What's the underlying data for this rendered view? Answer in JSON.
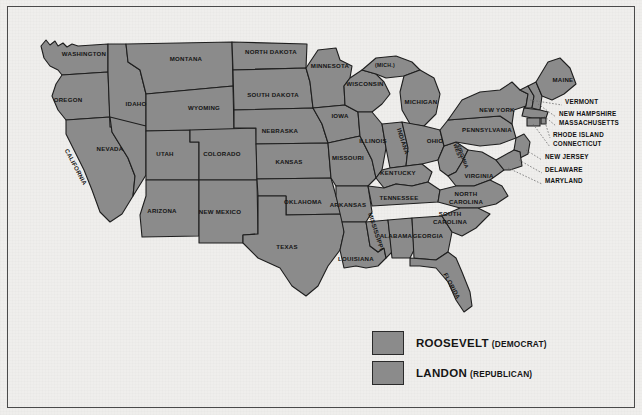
{
  "map": {
    "title_text": "",
    "fill_color": "#8b8b8b",
    "border_color": "#1e1e1e",
    "background_color": "#efeeec",
    "frame_color": "#4a4a4a"
  },
  "states": [
    {
      "name": "WASHINGTON",
      "x": 84,
      "y": 56,
      "rot": 0
    },
    {
      "name": "OREGON",
      "x": 68,
      "y": 102,
      "rot": 0
    },
    {
      "name": "CALIFORNIA",
      "x": 74,
      "y": 168,
      "rot": 62
    },
    {
      "name": "IDAHO",
      "x": 136,
      "y": 106,
      "rot": 0
    },
    {
      "name": "NEVADA",
      "x": 110,
      "y": 151,
      "rot": 0
    },
    {
      "name": "MONTANA",
      "x": 186,
      "y": 61,
      "rot": 0
    },
    {
      "name": "WYOMING",
      "x": 204,
      "y": 110,
      "rot": 0
    },
    {
      "name": "UTAH",
      "x": 165,
      "y": 156,
      "rot": 0
    },
    {
      "name": "ARIZONA",
      "x": 162,
      "y": 213,
      "rot": 0
    },
    {
      "name": "COLORADO",
      "x": 222,
      "y": 156,
      "rot": 0
    },
    {
      "name": "NEW MEXICO",
      "x": 220,
      "y": 214,
      "rot": 0
    },
    {
      "name": "NORTH DAKOTA",
      "x": 271,
      "y": 54,
      "rot": 0
    },
    {
      "name": "SOUTH DAKOTA",
      "x": 273,
      "y": 97,
      "rot": 0
    },
    {
      "name": "NEBRASKA",
      "x": 280,
      "y": 133,
      "rot": 0
    },
    {
      "name": "KANSAS",
      "x": 289,
      "y": 164,
      "rot": 0
    },
    {
      "name": "OKLAHOMA",
      "x": 303,
      "y": 204,
      "rot": 0
    },
    {
      "name": "TEXAS",
      "x": 287,
      "y": 249,
      "rot": 0
    },
    {
      "name": "MINNESTOA",
      "x": 0,
      "y": 0,
      "rot": 0,
      "skip": true
    },
    {
      "name": "MINNESOTA",
      "x": 330,
      "y": 68,
      "rot": 0
    },
    {
      "name": "IOWA",
      "x": 340,
      "y": 118,
      "rot": 0
    },
    {
      "name": "MISSOURI",
      "x": 348,
      "y": 160,
      "rot": 0
    },
    {
      "name": "ARKANSAS",
      "x": 348,
      "y": 207,
      "rot": 0
    },
    {
      "name": "LOUISIANA",
      "x": 356,
      "y": 261,
      "rot": 0
    },
    {
      "name": "WISCONSIN",
      "x": 365,
      "y": 86,
      "rot": 0
    },
    {
      "name": "ILLINOIS",
      "x": 373,
      "y": 143,
      "rot": 0
    },
    {
      "name": "MISSISSIPPI",
      "x": 374,
      "y": 232,
      "rot": 72
    },
    {
      "name": "(MICH.)",
      "x": 385,
      "y": 67,
      "rot": 0,
      "small": true
    },
    {
      "name": "MICHIGAN",
      "x": 421,
      "y": 104,
      "rot": 0
    },
    {
      "name": "INDIANA",
      "x": 401,
      "y": 142,
      "rot": 72
    },
    {
      "name": "KENTUCKY",
      "x": 398,
      "y": 175,
      "rot": 0
    },
    {
      "name": "TENNESSEE",
      "x": 399,
      "y": 200,
      "rot": 0
    },
    {
      "name": "ALABAMA",
      "x": 396,
      "y": 238,
      "rot": 0
    },
    {
      "name": "GEORGIA",
      "x": 428,
      "y": 238,
      "rot": 0
    },
    {
      "name": "FLORIDA",
      "x": 450,
      "y": 287,
      "rot": 62
    },
    {
      "name": "OHIO",
      "x": 435,
      "y": 143,
      "rot": 0
    },
    {
      "name": "WEST",
      "x": 456,
      "y": 152,
      "rot": 70,
      "small": true
    },
    {
      "name": "VIRGINIA",
      "x": 461,
      "y": 157,
      "rot": 70,
      "small": true
    },
    {
      "name": "VIRGINIA ",
      "x": 479,
      "y": 178,
      "rot": 0
    },
    {
      "name": "NORTH",
      "x": 466,
      "y": 196,
      "rot": 0
    },
    {
      "name": "CAROLINA",
      "x": 466,
      "y": 204,
      "rot": 0
    },
    {
      "name": "SOUTH",
      "x": 450,
      "y": 216,
      "rot": 0
    },
    {
      "name": "CAROLINA ",
      "x": 450,
      "y": 224,
      "rot": 0
    },
    {
      "name": "PENNSYLVANIA",
      "x": 487,
      "y": 132,
      "rot": 0
    },
    {
      "name": "NEW YORK",
      "x": 497,
      "y": 112,
      "rot": 0
    },
    {
      "name": "MAINE",
      "x": 563,
      "y": 82,
      "rot": 0
    }
  ],
  "callouts": [
    {
      "name": "VERMONT",
      "x": 565,
      "y": 104
    },
    {
      "name": "NEW HAMPSHIRE",
      "x": 559,
      "y": 116
    },
    {
      "name": "MASSACHUSETTS",
      "x": 559,
      "y": 125
    },
    {
      "name": "RHODE ISLAND",
      "x": 553,
      "y": 137
    },
    {
      "name": "CONNECTICUT",
      "x": 553,
      "y": 146
    },
    {
      "name": "NEW JERSEY",
      "x": 545,
      "y": 159
    },
    {
      "name": "DELAWARE",
      "x": 545,
      "y": 172
    },
    {
      "name": "MARYLAND",
      "x": 545,
      "y": 183
    }
  ],
  "legend": {
    "items": [
      {
        "candidate": "ROOSEVELT",
        "party": "(DEMOCRAT)",
        "color": "#8b8b8b"
      },
      {
        "candidate": "LANDON",
        "party": "(REPUBLICAN)",
        "color": "#8b8b8b"
      }
    ]
  }
}
